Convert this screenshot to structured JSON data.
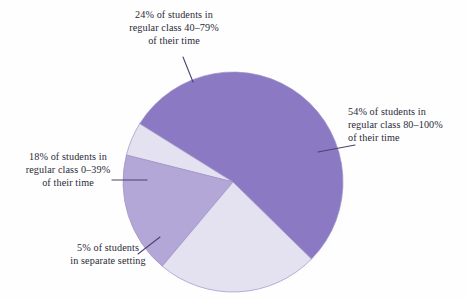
{
  "chart_data": {
    "type": "pie",
    "title": "",
    "subtitle": "",
    "xlabel": "",
    "ylabel": "",
    "legend_position": "callout-labels",
    "grid": false,
    "categories": [
      "Regular class 80-100% of their time",
      "Regular class 40-79% of their time",
      "Regular class 0-39% of their time",
      "Separate setting"
    ],
    "values": [
      54,
      24,
      18,
      5
    ],
    "units": "percent of students",
    "colors": [
      "#8b79c4",
      "#e4e1f1",
      "#b3a7d8",
      "#e4e1f1"
    ],
    "slices": [
      {
        "key": "regular-80-100",
        "value": 54,
        "color": "#8b79c4",
        "label_lines": [
          "54% of students in",
          "regular class 80–100%",
          "of their time"
        ]
      },
      {
        "key": "regular-40-79",
        "value": 24,
        "color": "#e4e1f1",
        "label_lines": [
          "24% of students in",
          "regular class 40–79%",
          "of their time"
        ]
      },
      {
        "key": "regular-0-39",
        "value": 18,
        "color": "#b3a7d8",
        "label_lines": [
          "18% of students in",
          "regular class 0–39%",
          "of their time"
        ]
      },
      {
        "key": "separate-setting",
        "value": 5,
        "color": "#e4e1f1",
        "label_lines": [
          "5% of students",
          "in separate setting"
        ]
      }
    ]
  },
  "labels": {
    "top": {
      "line1": "24% of students in",
      "line2": "regular class 40–79%",
      "line3": "of their time"
    },
    "right": {
      "line1": "54% of students in",
      "line2": "regular class 80–100%",
      "line3": "of their time"
    },
    "left": {
      "line1": "18% of students in",
      "line2": "regular class 0–39%",
      "line3": "of their time"
    },
    "bottom": {
      "line1": "5% of students",
      "line2": "in separate setting"
    }
  },
  "style": {
    "slice_major": "#8b79c4",
    "slice_mid": "#b3a7d8",
    "slice_light": "#e4e1f1",
    "outline": "#9d92c4",
    "leader": "#4b4270",
    "text": "#2a2a38",
    "background": "#fefefe"
  }
}
